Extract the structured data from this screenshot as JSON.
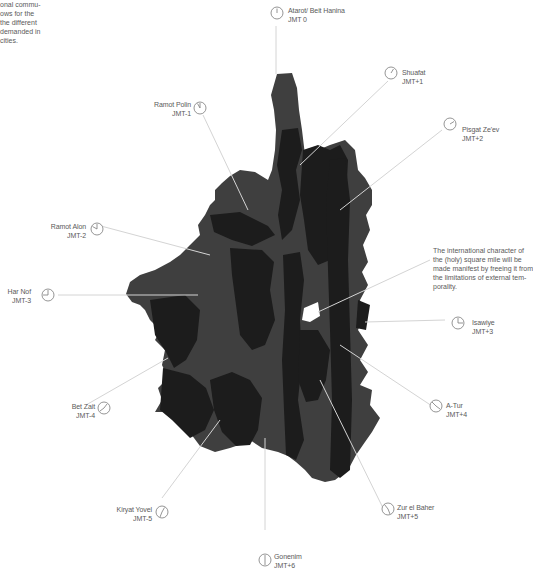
{
  "intro_text": "onal commu-\nows for the\n the different\n demanded in\ncities.",
  "note_text": "The international character of\nthe (holy) square mile will be\nmade manifest by freeing it from\nthe limitations of external tem-\nporality.",
  "colors": {
    "background": "#ffffff",
    "map_dark": "#1c1c1c",
    "map_mid": "#3f3f3f",
    "leader_line": "#d4d4d4",
    "clock_stroke": "#7a7a7a",
    "text": "#5a5a5a",
    "highlight": "#ffffff"
  },
  "districts": [
    {
      "name": "Atarot/ Beit Hanina",
      "offset": "JMT 0",
      "icon": "clock-icon",
      "hour": 0
    },
    {
      "name": "Shuafat",
      "offset": "JMT+1",
      "icon": "clock-icon",
      "hour": 1
    },
    {
      "name": "Pisgat Ze'ev",
      "offset": "JMT+2",
      "icon": "clock-icon",
      "hour": 2
    },
    {
      "name": "Isawiye",
      "offset": "JMT+3",
      "icon": "clock-icon",
      "hour": 3
    },
    {
      "name": "A-Tur",
      "offset": "JMT+4",
      "icon": "clock-icon",
      "hour": 4
    },
    {
      "name": "Zur el Baher",
      "offset": "JMT+5",
      "icon": "clock-icon",
      "hour": 5
    },
    {
      "name": "Gonenim",
      "offset": "JMT+6",
      "icon": "clock-icon",
      "hour": 6
    },
    {
      "name": "Kiryat Yovel",
      "offset": "JMT-5",
      "icon": "clock-icon",
      "hour": 7
    },
    {
      "name": "Bet Zait",
      "offset": "JMT-4",
      "icon": "clock-icon",
      "hour": 8
    },
    {
      "name": "Har Nof",
      "offset": "JMT-3",
      "icon": "clock-icon",
      "hour": 9
    },
    {
      "name": "Ramot Alon",
      "offset": "JMT-2",
      "icon": "clock-icon",
      "hour": 10
    },
    {
      "name": "Ramot Polin",
      "offset": "JMT-1",
      "icon": "clock-icon",
      "hour": 11
    }
  ]
}
